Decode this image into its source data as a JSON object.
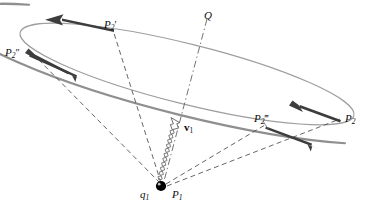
{
  "figure": {
    "background_color": "#ffffff",
    "width": 371,
    "height": 209
  },
  "colors": {
    "orbit_stroke": "#9a9a9a",
    "orbit_stroke_thick": "#8f8f8f",
    "arrow_fill": "#3d3d3d",
    "dashed_stroke": "#4a4a4a",
    "dashdot_stroke": "#5a5a5a",
    "charge_fill": "#000000",
    "label_color": "#0d0d0d",
    "coil_stroke": "#6b6b6b"
  },
  "labels": {
    "p2_prime": {
      "text": "P",
      "sub": "2",
      "prime": "′",
      "x": 104,
      "y": 19
    },
    "p2_double_prime": {
      "text": "P",
      "sub": "2",
      "prime": "″",
      "x": 5,
      "y": 47
    },
    "p2_triple_prime": {
      "text": "P",
      "sub": "2",
      "prime": "‴",
      "x": 254,
      "y": 113
    },
    "p2": {
      "text": "P",
      "sub": "2",
      "prime": "",
      "x": 345,
      "y": 113
    },
    "p1": {
      "text": "P",
      "sub": "1",
      "prime": "",
      "x": 172,
      "y": 189
    },
    "q1": {
      "text": "q",
      "sub": "1",
      "prime": "",
      "x": 140,
      "y": 189
    },
    "q_point": {
      "text": "Q",
      "sub": "",
      "prime": "",
      "x": 204,
      "y": 10
    },
    "v1": {
      "text": "v",
      "sub": "1",
      "prime": "",
      "x": 184,
      "y": 124
    }
  },
  "elements": {
    "orbit": "elliptical-orbit",
    "charge": "point-charge-q1",
    "velocity_vector": "velocity-vector-v1",
    "field_point": "field-point-Q",
    "retarded_positions": [
      "P2'",
      "P2''",
      "P2'''",
      "P2"
    ],
    "arrow_count": 5,
    "dashed_ray_count": 4
  },
  "geometry": {
    "ellipse": {
      "cx": 187,
      "cy": 74,
      "rx": 172,
      "ry": 30,
      "rotation_deg": 14
    },
    "charge_point": {
      "x": 162,
      "y": 186,
      "r": 5
    },
    "q_line": {
      "x1": 207,
      "y1": 19,
      "x2": 163,
      "y2": 183
    }
  }
}
